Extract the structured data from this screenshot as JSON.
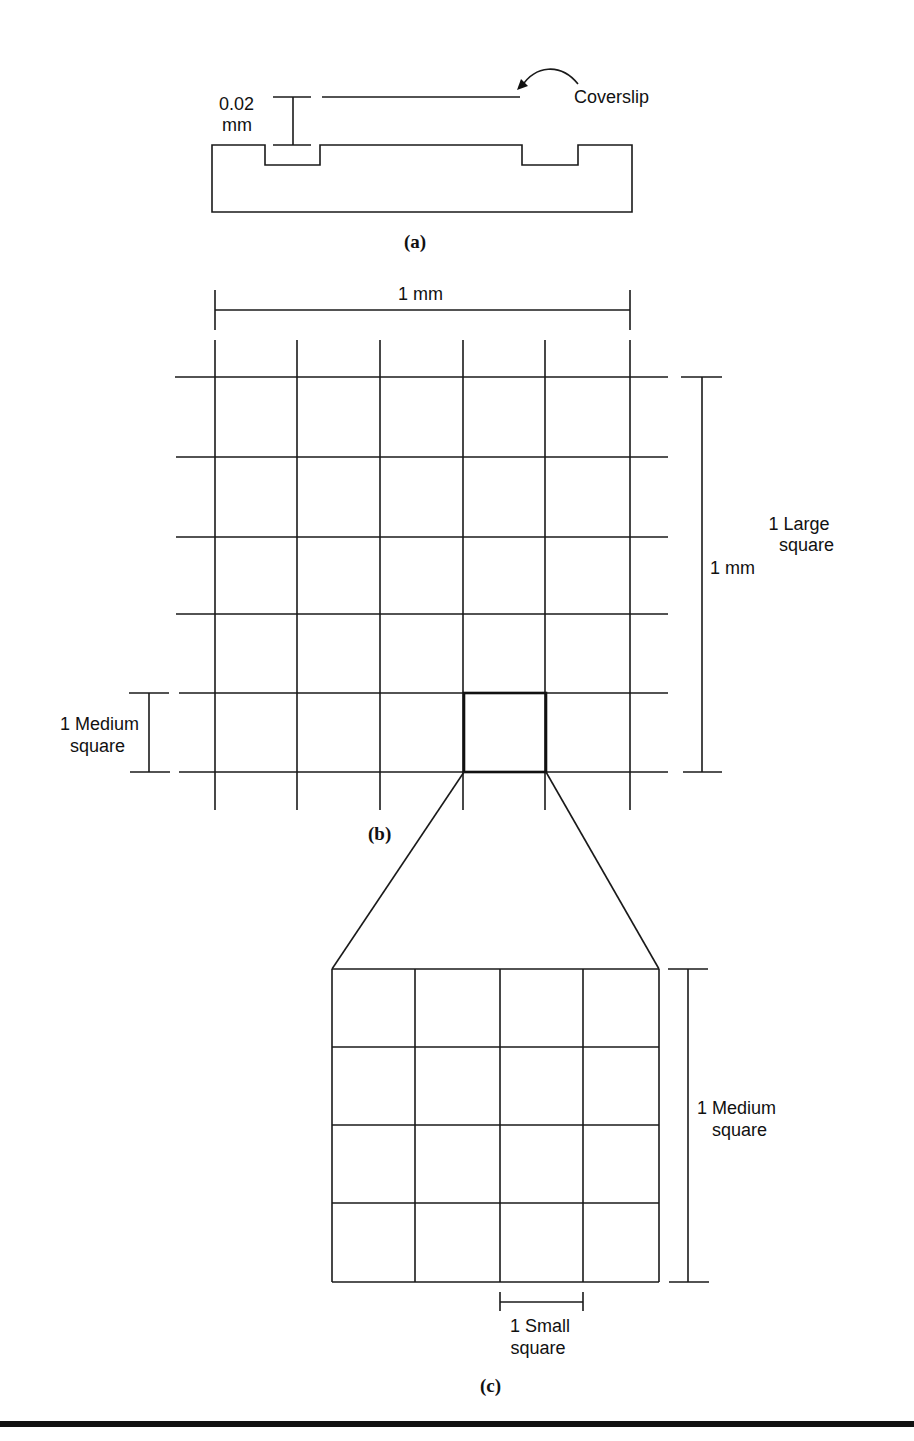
{
  "figure": {
    "panel_a": {
      "label": "(a)",
      "depth_value": "0.02",
      "depth_unit": "mm",
      "coverslip_label": "Coverslip"
    },
    "panel_b": {
      "label": "(b)",
      "width_dim": "1 mm",
      "height_dim": "1 mm",
      "large_square_line1": "1 Large",
      "large_square_line2": "square",
      "medium_square_line1": "1 Medium",
      "medium_square_line2": "square",
      "grid_divisions": 5
    },
    "panel_c": {
      "label": "(c)",
      "medium_square_line1": "1 Medium",
      "medium_square_line2": "square",
      "small_square_line1": "1 Small",
      "small_square_line2": "square",
      "grid_divisions": 4
    }
  },
  "colors": {
    "ink": "#111111",
    "background": "#ffffff"
  }
}
